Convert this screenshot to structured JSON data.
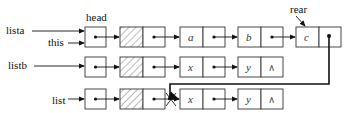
{
  "diagram": {
    "pointer_labels": {
      "lista": "lista",
      "this": "this",
      "head": "head",
      "rear": "rear",
      "listb": "listb",
      "list": "list"
    },
    "rows": [
      {
        "name": "lista",
        "nodes": [
          "head",
          "dummy",
          "a",
          "b",
          "c"
        ]
      },
      {
        "name": "listb",
        "nodes": [
          "head",
          "dummy",
          "x",
          "y",
          "null"
        ]
      },
      {
        "name": "list",
        "nodes": [
          "head",
          "dummy",
          "x",
          "y",
          "null"
        ]
      }
    ],
    "values": {
      "a": "a",
      "b": "b",
      "c": "c",
      "x1": "x",
      "y1": "y",
      "x2": "x",
      "y2": "y",
      "null1": "∧",
      "null2": "∧"
    }
  }
}
